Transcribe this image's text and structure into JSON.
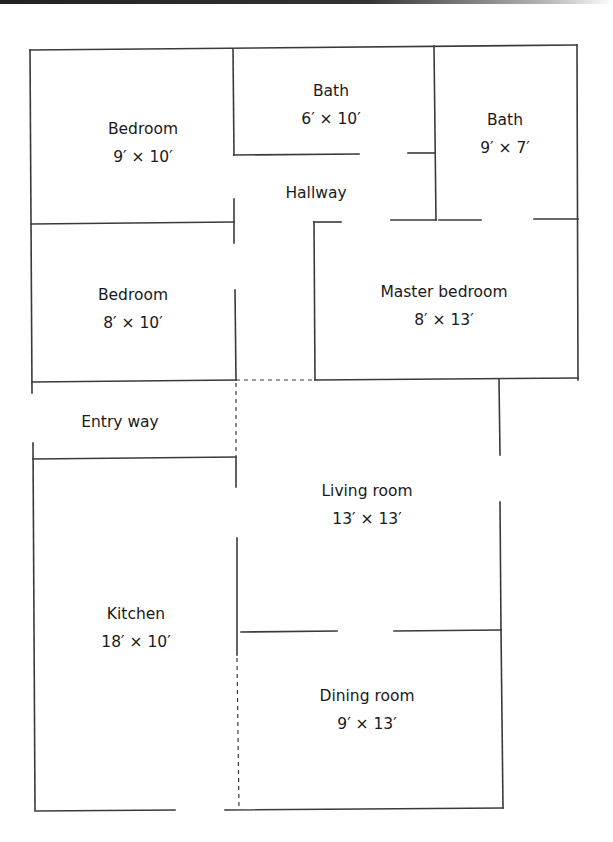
{
  "figure": {
    "type": "floor-plan",
    "wall_color": "#3a3a3a",
    "text_color": "#1a1a1a",
    "rooms": [
      {
        "id": "bedroom-1",
        "name": "Bedroom",
        "dims": "9′ × 10′",
        "x": 143,
        "y": 120
      },
      {
        "id": "bath-1",
        "name": "Bath",
        "dims": "6′ × 10′",
        "x": 331,
        "y": 82
      },
      {
        "id": "bath-2",
        "name": "Bath",
        "dims": "9′ × 7′",
        "x": 505,
        "y": 111
      },
      {
        "id": "hallway",
        "name": "Hallway",
        "dims": "",
        "x": 316,
        "y": 182
      },
      {
        "id": "bedroom-2",
        "name": "Bedroom",
        "dims": "8′ × 10′",
        "x": 133,
        "y": 284
      },
      {
        "id": "master-bedroom",
        "name": "Master bedroom",
        "dims": "8′ × 13′",
        "x": 444,
        "y": 282
      },
      {
        "id": "entry-way",
        "name": "Entry way",
        "dims": "",
        "x": 120,
        "y": 411
      },
      {
        "id": "living-room",
        "name": "Living room",
        "dims": "13′ × 13′",
        "x": 367,
        "y": 480
      },
      {
        "id": "kitchen",
        "name": "Kitchen",
        "dims": "18′ × 10′",
        "x": 136,
        "y": 603
      },
      {
        "id": "dining-room",
        "name": "Dining room",
        "dims": "9′ × 13′",
        "x": 367,
        "y": 685
      }
    ]
  }
}
